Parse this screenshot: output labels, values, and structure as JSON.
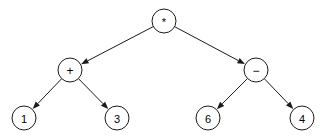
{
  "diagram": {
    "type": "binary-expression-tree",
    "expression": "(1 + 3) * (6 - 4)",
    "colors": {
      "background": "#ffffff",
      "stroke": "#1a1a1a",
      "node_fill": "#ffffff",
      "text": "#000000"
    },
    "node_radius": 12,
    "nodes": [
      {
        "id": "root",
        "label": "*",
        "kind": "operator",
        "cx": 164,
        "cy": 21,
        "font_class": "op op-star"
      },
      {
        "id": "plus",
        "label": "+",
        "kind": "operator",
        "cx": 70,
        "cy": 70,
        "font_class": "op"
      },
      {
        "id": "minus",
        "label": "−",
        "kind": "operator",
        "cx": 256,
        "cy": 70,
        "font_class": "op"
      },
      {
        "id": "one",
        "label": "1",
        "kind": "operand",
        "cx": 24,
        "cy": 118,
        "font_class": ""
      },
      {
        "id": "three",
        "label": "3",
        "kind": "operand",
        "cx": 117,
        "cy": 118,
        "font_class": ""
      },
      {
        "id": "six",
        "label": "6",
        "kind": "operand",
        "cx": 208,
        "cy": 118,
        "font_class": ""
      },
      {
        "id": "four",
        "label": "4",
        "kind": "operand",
        "cx": 302,
        "cy": 118,
        "font_class": ""
      }
    ],
    "edges": [
      {
        "id": "root-plus",
        "from": "root",
        "to": "plus",
        "arrow": true
      },
      {
        "id": "root-minus",
        "from": "root",
        "to": "minus",
        "arrow": true
      },
      {
        "id": "plus-one",
        "from": "plus",
        "to": "one",
        "arrow": true
      },
      {
        "id": "plus-three",
        "from": "plus",
        "to": "three",
        "arrow": true
      },
      {
        "id": "minus-six",
        "from": "minus",
        "to": "six",
        "arrow": true
      },
      {
        "id": "minus-four",
        "from": "minus",
        "to": "four",
        "arrow": true
      }
    ]
  }
}
